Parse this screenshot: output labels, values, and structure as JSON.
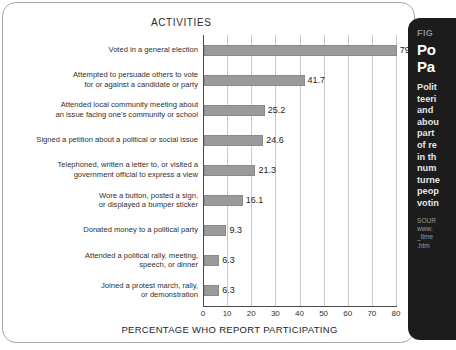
{
  "chart_data": {
    "type": "bar",
    "orientation": "horizontal",
    "title": "ACTIVITIES",
    "xlabel": "PERCENTAGE WHO REPORT PARTICIPATING",
    "ylabel": "",
    "xlim": [
      0,
      80
    ],
    "xticks": [
      0,
      10,
      20,
      30,
      40,
      50,
      60,
      70,
      80
    ],
    "xtick_labels": [
      "0",
      "10",
      "20",
      "30",
      "40",
      "50",
      "60",
      "70",
      "80"
    ],
    "grid": true,
    "grid_axis": "x",
    "legend": "none",
    "bar_color": "#9a9a9a",
    "categories": [
      "Voted in a general election",
      "Attempted to persuade others to vote\nfor or against a candidate or party",
      "Attended local community meeting about\nan issue facing one's community or school",
      "Signed a petition about a political or social issue",
      "Telephoned, written a letter to, or visited a\ngovernment official to express a view",
      "Wore a button, posted a sign,\nor displayed a bumper sticker",
      "Donated money to a political party",
      "Attended a political rally, meeting,\nspeech, or dinner",
      "Joined a protest march, rally,\nor demonstration"
    ],
    "values": [
      79.9,
      41.7,
      25.2,
      24.6,
      21.3,
      16.1,
      9.3,
      6.3,
      6.3
    ],
    "value_labels": [
      "79.9",
      "41.7",
      "25.2",
      "24.6",
      "21.3",
      "16.1",
      "9.3",
      "6.3",
      "6.3"
    ]
  },
  "side_panel": {
    "figure_number": "FIG",
    "title": "Po\nPa",
    "body": "Polit\nteeri\nand\nabou\npart\nof re\nin th\nnum\nturne\npeop\nvotin",
    "source": "SOUR\nwww.\n_time\n.htm"
  }
}
